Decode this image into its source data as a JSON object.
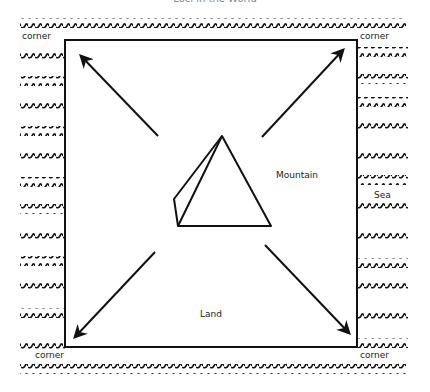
{
  "title": "Loci in the World",
  "labels": {
    "corner_top_left": "corner",
    "corner_top_right": "corner",
    "corner_bottom_left": "corner",
    "corner_bottom_right": "corner",
    "mountain": "Mountain",
    "sea": "Sea",
    "land": "Land"
  },
  "colors": {
    "ink": "#111111",
    "background": "#ffffff"
  },
  "diagram": {
    "square": {
      "x": 65,
      "y": 40,
      "width": 292,
      "height": 307
    },
    "arrows": [
      {
        "name": "arrow-top-left",
        "from": [
          158,
          136
        ],
        "to": [
          81,
          56
        ]
      },
      {
        "name": "arrow-top-right",
        "from": [
          262,
          137
        ],
        "to": [
          343,
          50
        ]
      },
      {
        "name": "arrow-bottom-left",
        "from": [
          155,
          252
        ],
        "to": [
          75,
          337
        ]
      },
      {
        "name": "arrow-bottom-right",
        "from": [
          265,
          245
        ],
        "to": [
          349,
          333
        ]
      }
    ],
    "mountain": {
      "apex": [
        222,
        136
      ],
      "base_left": [
        178,
        226
      ],
      "base_right": [
        271,
        226
      ],
      "back_left": [
        174,
        199
      ]
    },
    "waves_left_rows_y": [
      55,
      82,
      108,
      132,
      158,
      183,
      210,
      237,
      262,
      288,
      314,
      345
    ],
    "waves_right_rows_y": [
      53,
      80,
      103,
      129,
      156,
      181,
      208,
      236,
      264,
      289,
      316,
      344
    ],
    "wave_top_y": 24,
    "wave_bottom_y": 370
  }
}
